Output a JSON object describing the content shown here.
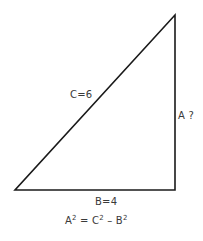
{
  "diagram": {
    "line_color": "#1a1a1a",
    "text_color": "#3a3a3a",
    "vertices": {
      "bottom_left": [
        15,
        190
      ],
      "bottom_right": [
        175,
        190
      ],
      "top": [
        175,
        15
      ]
    },
    "labels": {
      "hypotenuse": "C=6",
      "vertical_side": "A ?",
      "base": "B=4"
    },
    "formula": {
      "a": "A",
      "exp1": "2",
      "eq": " = C",
      "exp2": "2",
      "minus": " – B",
      "exp3": "2"
    }
  }
}
